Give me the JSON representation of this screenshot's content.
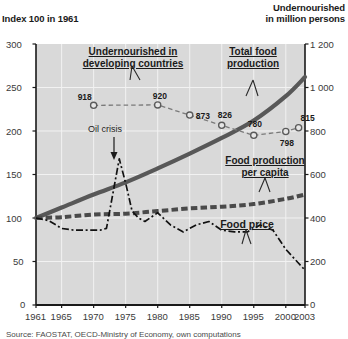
{
  "titles": {
    "left_axis": "Index 100 in 1961",
    "right_axis": "Undernourished\nin million persons",
    "right_axis_line1": "Undernourished",
    "right_axis_line2": "in million persons"
  },
  "annotations": {
    "undernourished_label_line1": "Undernourished in",
    "undernourished_label_line2": "developing countries",
    "total_food_line1": "Total food",
    "total_food_line2": "production",
    "per_capita_line1": "Food production",
    "per_capita_line2": "per capita",
    "food_price": "Food price",
    "oil_crisis": "Oil crisis"
  },
  "source": "Source: FAOSTAT, OECD-Ministry of Economy, own computations",
  "colors": {
    "plot_background": "#d9d9d9",
    "grid": "#f2f2f2",
    "axis": "#1a1a1a",
    "total_food_production": "#4a4a4a",
    "per_capita": "#3a3a3a",
    "food_price": "#1a1a1a",
    "undernourished": "#6b6b6b",
    "text": "#1b1b1b"
  },
  "chart_data": {
    "type": "line",
    "title": "",
    "xlabel": "",
    "ylabel": "Index 100 in 1961",
    "y2label": "Undernourished in million persons",
    "grid": true,
    "legend": "inline-annotations",
    "xlim": [
      1961,
      2003
    ],
    "ylim": [
      0,
      300
    ],
    "y2lim": [
      0,
      1200
    ],
    "xticks": [
      1961,
      1965,
      1970,
      1975,
      1980,
      1985,
      1990,
      1995,
      2000,
      2003
    ],
    "yticks": [
      0,
      50,
      100,
      150,
      200,
      250,
      300
    ],
    "y2ticks": [
      0,
      200,
      400,
      600,
      800,
      1000,
      1200
    ],
    "series": [
      {
        "name": "Total food production",
        "axis": "left",
        "style": "thick-solid-gray",
        "x": [
          1961,
          1965,
          1970,
          1975,
          1980,
          1985,
          1990,
          1995,
          2000,
          2003
        ],
        "values": [
          100,
          112,
          127,
          141,
          157,
          174,
          192,
          212,
          240,
          262
        ]
      },
      {
        "name": "Food production per capita",
        "axis": "left",
        "style": "thick-dashed-gray",
        "x": [
          1961,
          1965,
          1970,
          1975,
          1980,
          1985,
          1990,
          1995,
          2000,
          2003
        ],
        "values": [
          100,
          101,
          104,
          105,
          108,
          111,
          113,
          116,
          122,
          127
        ]
      },
      {
        "name": "Food price",
        "axis": "left",
        "style": "dash-dot-black",
        "x": [
          1961,
          1963,
          1965,
          1967,
          1969,
          1971,
          1972,
          1973,
          1974,
          1975,
          1976,
          1977,
          1978,
          1980,
          1982,
          1984,
          1986,
          1988,
          1990,
          1992,
          1994,
          1996,
          1998,
          2000,
          2002,
          2003
        ],
        "values": [
          100,
          97,
          88,
          86,
          86,
          86,
          88,
          128,
          168,
          140,
          108,
          100,
          96,
          106,
          92,
          84,
          92,
          96,
          86,
          84,
          84,
          92,
          86,
          64,
          48,
          40
        ]
      },
      {
        "name": "Undernourished in developing countries",
        "axis": "right",
        "style": "thin-dashed-open-circles",
        "x": [
          1970,
          1980,
          1985,
          1990,
          1995,
          2000,
          2002
        ],
        "values": [
          918,
          920,
          873,
          826,
          780,
          798,
          815
        ],
        "point_labels": [
          "918",
          "920",
          "873",
          "826",
          "780",
          "798",
          "815"
        ]
      }
    ]
  }
}
